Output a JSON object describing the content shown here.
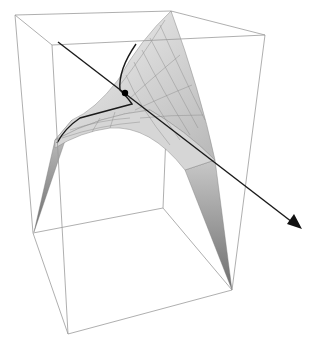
{
  "figure": {
    "colors": {
      "background": "#ffffff",
      "box_edge": "#9a9a9a",
      "surface_light": "#ececec",
      "surface_dark": "#8a8a8a",
      "mesh": "#7a7a7a",
      "line": "#1a1a1a",
      "point": "#000000"
    },
    "box": {
      "top": [
        [
          15,
          15
        ],
        [
          171,
          11
        ],
        [
          265,
          35
        ],
        [
          52,
          45
        ]
      ],
      "bottom": [
        [
          33,
          233
        ],
        [
          163,
          208
        ],
        [
          232,
          290
        ],
        [
          68,
          334
        ]
      ]
    },
    "line": {
      "start": [
        58,
        42
      ],
      "end": [
        300,
        228
      ],
      "arrowhead": true
    },
    "intersection_point": [
      125,
      93
    ]
  }
}
